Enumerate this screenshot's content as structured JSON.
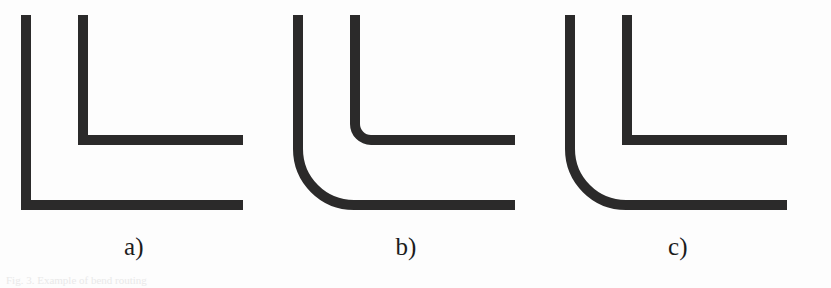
{
  "figure": {
    "background_color": "#fdfdfd",
    "stroke_color": "#2b2a2a",
    "caption_color": "#1c1c1c",
    "width": 831,
    "height": 288,
    "bottom_caption": "Fig. 3. Example of bend routing",
    "panels": [
      {
        "id": "a",
        "label": "a)",
        "description": "both corners sharp (mitred)",
        "outer": {
          "corner": "sharp",
          "radius": 0,
          "x_start": 26,
          "y_start": 15,
          "x_end": 243,
          "y_end": 210,
          "thickness": 10
        },
        "inner": {
          "corner": "sharp",
          "radius": 0,
          "x_start": 83,
          "y_start": 15,
          "x_end": 243,
          "y_end": 145,
          "thickness": 10
        }
      },
      {
        "id": "b",
        "label": "b)",
        "description": "both corners rounded",
        "outer": {
          "corner": "rounded",
          "radius": 56,
          "x_start": 26,
          "y_start": 15,
          "x_end": 243,
          "y_end": 210,
          "thickness": 10
        },
        "inner": {
          "corner": "rounded",
          "radius": 16,
          "x_start": 83,
          "y_start": 15,
          "x_end": 243,
          "y_end": 145,
          "thickness": 10
        }
      },
      {
        "id": "c",
        "label": "c)",
        "description": "outer corner rounded, inner corner sharp",
        "outer": {
          "corner": "rounded",
          "radius": 56,
          "x_start": 26,
          "y_start": 15,
          "x_end": 243,
          "y_end": 210,
          "thickness": 10
        },
        "inner": {
          "corner": "sharp",
          "radius": 0,
          "x_start": 83,
          "y_start": 15,
          "x_end": 243,
          "y_end": 145,
          "thickness": 10
        }
      }
    ],
    "panel_offsets": [
      0,
      272,
      544
    ],
    "panel_width": 268
  }
}
